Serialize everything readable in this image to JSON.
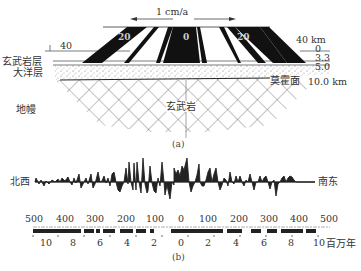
{
  "figure_a": {
    "caption": "(a)",
    "velocity_label": "1 cm/a",
    "left_arrow": "left",
    "right_arrow": "right",
    "stripe_labels": [
      "20",
      "0",
      "20"
    ],
    "left_scale_label": "40",
    "right_scale_label": "40 km",
    "depth_labels": [
      "0",
      "3.3",
      "5.0",
      "10.0 km"
    ],
    "layer_labels": {
      "basalt_layer": "玄武岩层",
      "ocean_layer": "大洋层",
      "mantle": "地幔",
      "basalt": "玄武岩",
      "moho": "莫霍面"
    }
  },
  "figure_b": {
    "caption": "(b)",
    "left_direction": "北西",
    "right_direction": "南东",
    "km_scale": [
      "500",
      "400",
      "300",
      "200",
      "100",
      "0",
      "100",
      "200",
      "300",
      "400",
      "500"
    ],
    "ma_scale": [
      "10",
      "8",
      "6",
      "4",
      "2",
      "0",
      "2",
      "4",
      "6",
      "8",
      "10"
    ],
    "ma_unit": "百万年"
  },
  "colors": {
    "ink": "#111111",
    "line": "#333333",
    "sediment_dots": "#777777",
    "background": "#ffffff"
  }
}
